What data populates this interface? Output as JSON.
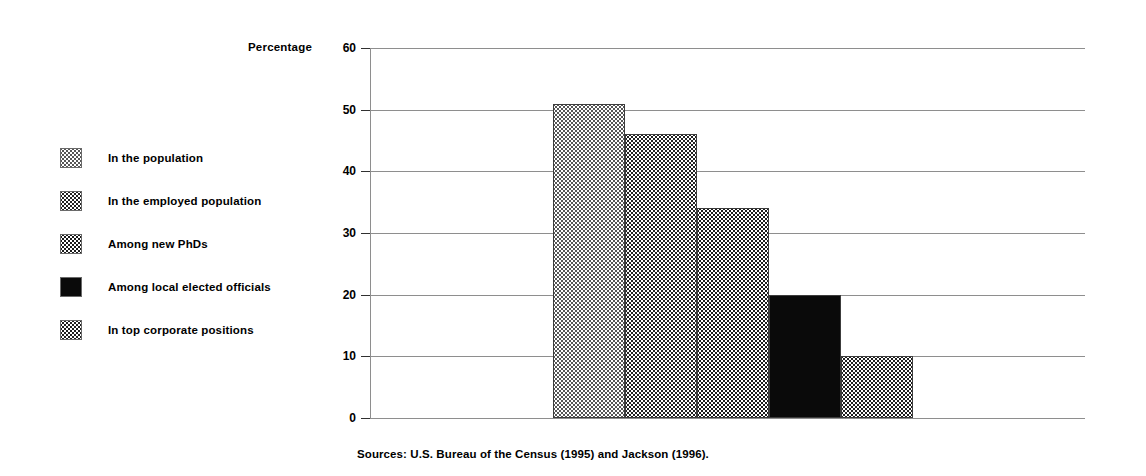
{
  "axis_title": "Percentage",
  "source_note": "Sources: U.S. Bureau of the Census (1995) and Jackson (1996).",
  "legend": {
    "items": [
      {
        "label": "In the population",
        "pattern": "light-dotted-swatch"
      },
      {
        "label": "In the employed population",
        "pattern": "medium-dotted-swatch"
      },
      {
        "label": "Among new PhDs",
        "pattern": "dark-dotted-swatch"
      },
      {
        "label": "Among local elected officials",
        "pattern": "solid-black-swatch"
      },
      {
        "label": "In top corporate positions",
        "pattern": "checker-dotted-swatch"
      }
    ]
  },
  "chart_data": {
    "type": "bar",
    "title": "",
    "xlabel": "",
    "ylabel": "Percentage",
    "ylim": [
      0,
      60
    ],
    "yticks": [
      0,
      10,
      20,
      30,
      40,
      50,
      60
    ],
    "ytick_labels": [
      "0",
      "10",
      "20",
      "30",
      "40",
      "50",
      "60"
    ],
    "grid": true,
    "legend_position": "left",
    "categories": [
      "In the population",
      "In the employed population",
      "Among new PhDs",
      "Among local elected officials",
      "In top corporate positions"
    ],
    "values": [
      51,
      46,
      34,
      20,
      10
    ],
    "annotations": [
      "Sources: U.S. Bureau of the Census (1995) and Jackson (1996)."
    ]
  }
}
